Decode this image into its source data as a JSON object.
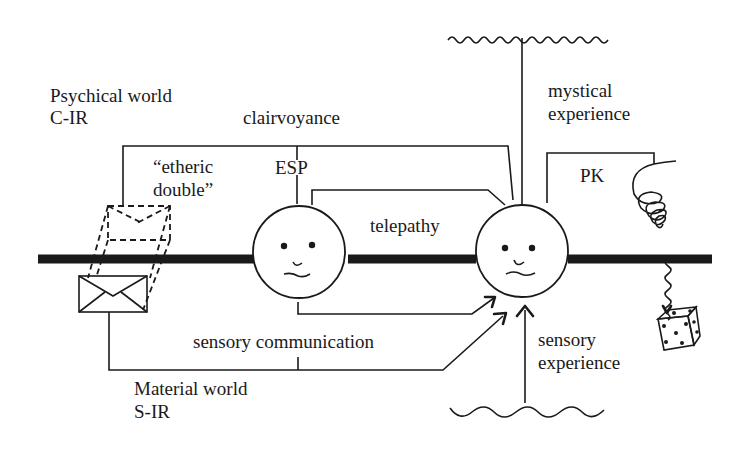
{
  "diagram": {
    "labels": {
      "psychical_world": "Psychical world",
      "psychical_code": "C-IR",
      "clairvoyance": "clairvoyance",
      "etheric_line1": "“etheric",
      "etheric_line2": "double”",
      "esp": "ESP",
      "telepathy": "telepathy",
      "mystical_line1": "mystical",
      "mystical_line2": "experience",
      "pk": "PK",
      "sensory_communication": "sensory communication",
      "sensory_exp_line1": "sensory",
      "sensory_exp_line2": "experience",
      "material_world": "Material world",
      "material_code": "S-IR"
    },
    "nodes": [
      {
        "id": "sender-face",
        "type": "person",
        "icon": "smiley-face-icon"
      },
      {
        "id": "receiver-face",
        "type": "person",
        "icon": "smiley-face-icon"
      },
      {
        "id": "envelope",
        "type": "object",
        "icon": "envelope-icon"
      },
      {
        "id": "etheric-double",
        "type": "object",
        "icon": "dashed-envelope-double-icon"
      },
      {
        "id": "dice",
        "type": "object",
        "icon": "dice-icon"
      },
      {
        "id": "spring",
        "type": "force",
        "icon": "coil-spring-icon"
      }
    ],
    "connections": [
      {
        "from": "etheric-double",
        "to": "receiver-face",
        "label": "clairvoyance"
      },
      {
        "from": "sender-face",
        "to": "receiver-face",
        "label": "telepathy"
      },
      {
        "from": "sender-face",
        "to": "receiver-face",
        "label": "sensory communication"
      },
      {
        "from": "envelope",
        "to": "receiver-face",
        "label": "sensory communication"
      },
      {
        "from": "mystical-source",
        "to": "receiver-face",
        "label": "mystical experience"
      },
      {
        "from": "sensory-source",
        "to": "receiver-face",
        "label": "sensory experience"
      },
      {
        "from": "receiver-face",
        "to": "dice",
        "label": "PK"
      }
    ],
    "colors": {
      "ink": "#1a1a1a",
      "background": "#ffffff"
    }
  }
}
